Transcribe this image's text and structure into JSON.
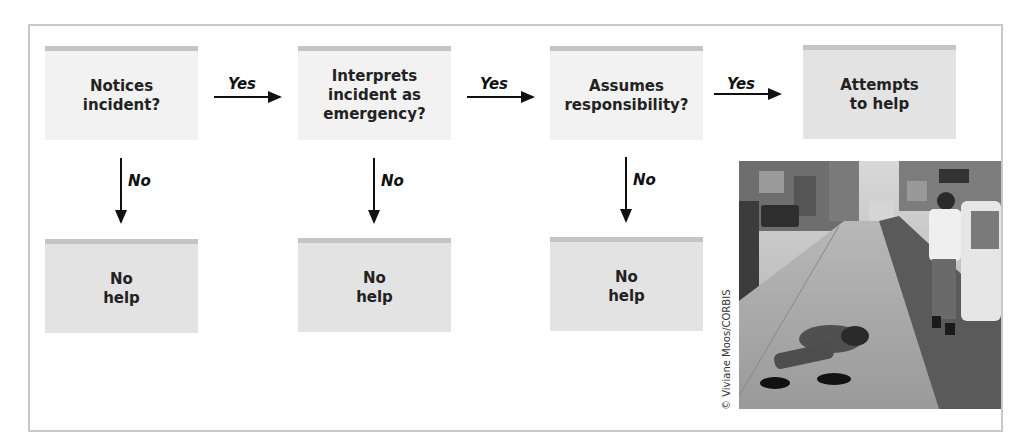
{
  "diagram": {
    "steps": [
      {
        "label": "Notices\nincident?",
        "yes_label": "Yes",
        "no_label": "No",
        "no_outcome": "No\nhelp"
      },
      {
        "label": "Interprets\nincident as\nemergency?",
        "yes_label": "Yes",
        "no_label": "No",
        "no_outcome": "No\nhelp"
      },
      {
        "label": "Assumes\nresponsibility?",
        "yes_label": "Yes",
        "no_label": "No",
        "no_outcome": "No\nhelp"
      }
    ],
    "final_outcome": "Attempts\nto help"
  },
  "photo": {
    "description": "Street photo: a man lying on a sidewalk while a pedestrian walks past",
    "credit": "© Viviane Moos/CORBIS"
  },
  "colors": {
    "question_box": "#f2f2f2",
    "outcome_box": "#e3e3e3",
    "box_top_bar": "#c4c4c4",
    "frame_border": "#c8c8c8",
    "arrow": "#111111"
  }
}
